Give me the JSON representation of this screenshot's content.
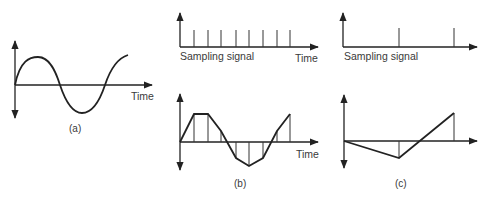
{
  "panels": {
    "a": {
      "caption": "(a)",
      "x_label": "Time",
      "description": "Continuous analog sine wave"
    },
    "b": {
      "sampling_label": "Sampling signal",
      "x_label": "Time",
      "caption": "(b)",
      "sample_count": 8,
      "description": "High sampling rate reconstructs waveform closely"
    },
    "c": {
      "sampling_label": "Sampling signal",
      "caption": "(c)",
      "sample_count": 2,
      "description": "Low sampling rate (aliasing) distorts waveform"
    }
  },
  "colors": {
    "line": "#222222",
    "text": "#3a3a3a",
    "background": "#ffffff"
  }
}
